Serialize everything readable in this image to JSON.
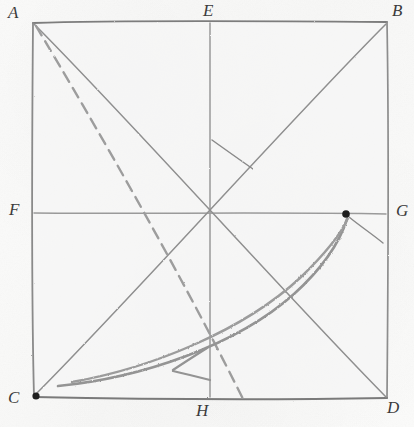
{
  "figure": {
    "kind": "hand-drawn-geometry-sketch",
    "medium": "pencil-on-paper",
    "canvas": {
      "width": 414,
      "height": 427
    },
    "colors": {
      "paper": "#fbfbfa",
      "pencil_stroke": "#6e6e6e",
      "pencil_light": "#a9a9a9",
      "curve_stroke": "#8e8e8e",
      "label_text": "#3b3b3b",
      "dot_fill": "#1d1d1d"
    },
    "square": {
      "name": "square-abdc",
      "corners": {
        "A": {
          "x": 33,
          "y": 22
        },
        "B": {
          "x": 387,
          "y": 22
        },
        "C": {
          "x": 33,
          "y": 398
        },
        "D": {
          "x": 387,
          "y": 398
        }
      }
    },
    "midpoints": {
      "E": {
        "x": 210,
        "y": 22
      },
      "F": {
        "x": 33,
        "y": 213
      },
      "G": {
        "x": 387,
        "y": 213
      },
      "H": {
        "x": 210,
        "y": 398
      }
    },
    "center": {
      "x": 210,
      "y": 213
    },
    "labels": [
      {
        "id": "label-A",
        "text": "A",
        "x": 8,
        "y": 4
      },
      {
        "id": "label-E",
        "text": "E",
        "x": 203,
        "y": 2
      },
      {
        "id": "label-B",
        "text": "B",
        "x": 392,
        "y": 2
      },
      {
        "id": "label-F",
        "text": "F",
        "x": 9,
        "y": 201
      },
      {
        "id": "label-G",
        "text": "G",
        "x": 395,
        "y": 202
      },
      {
        "id": "label-C",
        "text": "C",
        "x": 8,
        "y": 389
      },
      {
        "id": "label-H",
        "text": "H",
        "x": 196,
        "y": 403
      },
      {
        "id": "label-D",
        "text": "D",
        "x": 386,
        "y": 399
      }
    ],
    "segments": [
      {
        "id": "median-vertical-EH",
        "from": "E",
        "to": "H",
        "style": "solid"
      },
      {
        "id": "median-horizontal-FG",
        "from": "F",
        "to": "G",
        "style": "solid"
      },
      {
        "id": "diagonal-AD",
        "from": "A",
        "to": "D",
        "style": "solid"
      },
      {
        "id": "diagonal-BC",
        "from": "B",
        "to": "C",
        "style": "solid"
      },
      {
        "id": "dashed-line-A-to-H",
        "from": "A",
        "to": "near-H",
        "style": "dashed"
      },
      {
        "id": "tick-mark-upper-right-quadrant",
        "style": "solid-short"
      },
      {
        "id": "short-line-from-marked-point-to-edge",
        "style": "solid-short"
      }
    ],
    "marked_points": [
      {
        "id": "dot-at-C",
        "x": 36,
        "y": 396,
        "on": "corner-C"
      },
      {
        "id": "dot-on-FG",
        "x": 346,
        "y": 214,
        "on": "median-horizontal-FG"
      }
    ],
    "curve": {
      "id": "swept-arc",
      "description": "thick double-stroked arc sweeping from near C up to the marked point on FG",
      "start": {
        "x": 58,
        "y": 385
      },
      "end": {
        "x": 347,
        "y": 218
      },
      "arrowhead": {
        "x": 172,
        "y": 371,
        "direction": "left"
      }
    }
  }
}
